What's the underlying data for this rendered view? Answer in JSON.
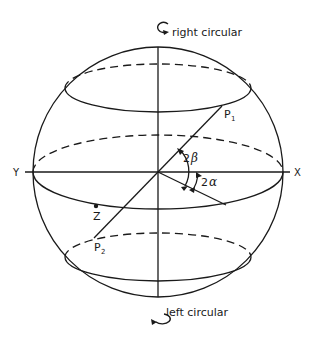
{
  "diagram": {
    "labels": {
      "top_pole": "right circular",
      "bottom_pole": "left circular",
      "axis_left": "Y",
      "axis_right": "X",
      "point_p1": "P",
      "point_p1_sub": "1",
      "point_p2": "P",
      "point_p2_sub": "2",
      "point_z": "Z",
      "angle_beta_num": "2",
      "angle_beta_sym": "β",
      "angle_alpha_num": "2",
      "angle_alpha_sym": "α"
    },
    "icons": {
      "top_rotation": "clockwise-rotation-arrow",
      "bottom_rotation": "counterclockwise-rotation-arrow"
    },
    "colors": {
      "stroke": "#1a1a1a",
      "background": "#ffffff"
    },
    "geometry": {
      "center": [
        158,
        172
      ],
      "radius": 125,
      "latitude_circles": [
        "upper",
        "equator",
        "lower"
      ]
    }
  }
}
